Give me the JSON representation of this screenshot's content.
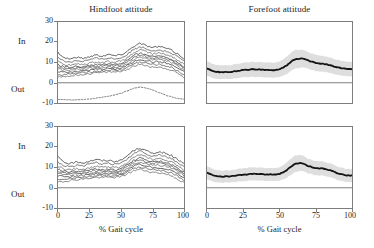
{
  "figure": {
    "xlabel": "% Gait cycle",
    "direction_labels": {
      "positive": "In",
      "negative": "Out"
    }
  },
  "chart_data": [
    {
      "id": "hindfoot-top",
      "type": "line",
      "title": "Hindfoot attitude",
      "xlabel": "% Gait cycle",
      "ylabel": "",
      "xlim": [
        0,
        100
      ],
      "ylim": [
        -10,
        30
      ],
      "xticks": [
        0,
        25,
        50,
        75,
        100
      ],
      "yticks": [
        -10,
        0,
        10,
        20,
        30
      ],
      "grid": false,
      "legend": "none",
      "zero_line": 0,
      "axis_direction_positive": "In",
      "axis_direction_negative": "Out",
      "x": [
        0,
        5,
        10,
        15,
        20,
        25,
        30,
        35,
        40,
        45,
        50,
        55,
        60,
        65,
        70,
        75,
        80,
        85,
        90,
        95,
        100
      ],
      "series": [
        {
          "name": "trial-1",
          "style": "solid",
          "values": [
            15.0,
            12.3,
            11.8,
            12.6,
            12.0,
            12.9,
            13.8,
            13.2,
            14.0,
            13.4,
            13.8,
            15.6,
            18.0,
            19.5,
            18.4,
            17.3,
            17.9,
            17.2,
            16.1,
            14.2,
            12.0
          ]
        },
        {
          "name": "trial-2",
          "style": "solid",
          "values": [
            12.4,
            10.6,
            10.3,
            11.0,
            10.6,
            11.4,
            12.1,
            11.6,
            12.3,
            11.8,
            12.2,
            14.0,
            16.4,
            17.9,
            16.9,
            15.8,
            16.3,
            15.6,
            14.5,
            12.8,
            10.7
          ]
        },
        {
          "name": "trial-3",
          "style": "solid",
          "values": [
            10.5,
            9.0,
            8.7,
            9.2,
            9.0,
            9.7,
            10.3,
            10.0,
            10.6,
            10.2,
            10.6,
            12.3,
            14.7,
            16.2,
            15.3,
            14.2,
            14.7,
            14.1,
            13.0,
            11.3,
            9.2
          ]
        },
        {
          "name": "trial-4",
          "style": "solid",
          "values": [
            9.0,
            7.8,
            7.6,
            8.0,
            7.9,
            8.5,
            9.0,
            8.8,
            9.3,
            9.0,
            9.4,
            11.0,
            13.3,
            14.7,
            13.9,
            12.9,
            13.3,
            12.8,
            11.7,
            10.0,
            8.0
          ]
        },
        {
          "name": "trial-5",
          "style": "solid",
          "values": [
            8.0,
            7.0,
            6.9,
            7.3,
            7.2,
            7.8,
            8.2,
            8.1,
            8.6,
            8.3,
            8.7,
            10.2,
            12.4,
            13.7,
            13.0,
            12.1,
            12.4,
            11.9,
            10.9,
            9.2,
            7.2
          ]
        },
        {
          "name": "trial-6",
          "style": "solid",
          "values": [
            7.0,
            6.2,
            6.2,
            6.6,
            6.6,
            7.1,
            7.5,
            7.4,
            7.9,
            7.7,
            8.0,
            9.4,
            11.5,
            12.7,
            12.1,
            11.3,
            11.5,
            11.0,
            10.0,
            8.3,
            6.3
          ]
        },
        {
          "name": "trial-7",
          "style": "solid",
          "values": [
            5.6,
            5.2,
            5.3,
            5.7,
            5.8,
            6.2,
            6.6,
            6.6,
            7.1,
            6.9,
            7.2,
            8.5,
            10.4,
            11.5,
            11.0,
            10.2,
            10.3,
            9.8,
            8.8,
            7.2,
            5.2
          ]
        },
        {
          "name": "trial-8",
          "style": "solid",
          "values": [
            4.0,
            4.0,
            4.3,
            4.7,
            4.9,
            5.3,
            5.7,
            5.8,
            6.2,
            6.1,
            6.4,
            7.6,
            9.3,
            10.2,
            9.7,
            9.0,
            9.0,
            8.5,
            7.5,
            5.9,
            3.9
          ]
        },
        {
          "name": "trial-9",
          "style": "solid",
          "values": [
            2.8,
            3.0,
            3.4,
            3.8,
            4.1,
            4.5,
            4.9,
            5.0,
            5.4,
            5.3,
            5.6,
            6.7,
            8.2,
            9.0,
            8.5,
            7.8,
            7.7,
            7.2,
            6.2,
            4.6,
            2.6
          ]
        },
        {
          "name": "reference-dotted",
          "style": "dotted",
          "values": [
            -8.2,
            -8.3,
            -8.4,
            -8.4,
            -8.3,
            -8.0,
            -7.6,
            -7.2,
            -6.7,
            -6.0,
            -5.2,
            -4.0,
            -2.8,
            -2.2,
            -2.6,
            -3.6,
            -4.8,
            -6.0,
            -7.0,
            -7.8,
            -8.2
          ]
        }
      ]
    },
    {
      "id": "forefoot-top",
      "type": "line",
      "title": "Forefoot attitude",
      "xlabel": "% Gait cycle",
      "ylabel": "",
      "xlim": [
        0,
        100
      ],
      "ylim": [
        -10,
        30
      ],
      "xticks": [
        0,
        25,
        50,
        75,
        100
      ],
      "yticks": [
        -10,
        0,
        10,
        20,
        30
      ],
      "grid": false,
      "legend": "none",
      "zero_line": 0,
      "band": "mean +/- 1 SD",
      "band_color": "#d9d9d9",
      "mean_color": "#111111",
      "x": [
        0,
        5,
        10,
        15,
        20,
        25,
        30,
        35,
        40,
        45,
        50,
        55,
        60,
        65,
        70,
        75,
        80,
        85,
        90,
        95,
        100
      ],
      "series": [
        {
          "name": "mean",
          "style": "solid-thick",
          "values": [
            7.0,
            5.6,
            5.2,
            5.3,
            5.7,
            6.2,
            6.6,
            6.6,
            6.4,
            6.3,
            6.5,
            8.6,
            11.4,
            12.1,
            10.9,
            9.9,
            9.4,
            8.7,
            7.6,
            6.9,
            6.6
          ]
        },
        {
          "name": "sd",
          "style": "band",
          "values": [
            3.6,
            3.5,
            3.4,
            3.4,
            3.5,
            3.6,
            3.7,
            3.7,
            3.7,
            3.7,
            3.8,
            4.3,
            4.6,
            4.4,
            4.1,
            4.0,
            3.9,
            3.8,
            3.7,
            3.6,
            3.6
          ]
        }
      ]
    },
    {
      "id": "hindfoot-bottom",
      "type": "line",
      "title": "",
      "xlabel": "% Gait cycle",
      "ylabel": "",
      "xlim": [
        0,
        100
      ],
      "ylim": [
        -10,
        30
      ],
      "xticks": [
        0,
        25,
        50,
        75,
        100
      ],
      "yticks": [
        -10,
        0,
        10,
        20,
        30
      ],
      "grid": false,
      "legend": "none",
      "zero_line": 0,
      "axis_direction_positive": "In",
      "axis_direction_negative": "Out",
      "x": [
        0,
        5,
        10,
        15,
        20,
        25,
        30,
        35,
        40,
        45,
        50,
        55,
        60,
        65,
        70,
        75,
        80,
        85,
        90,
        95,
        100
      ],
      "series": [
        {
          "name": "trial-1",
          "style": "solid",
          "values": [
            15.2,
            12.6,
            11.9,
            12.8,
            12.3,
            13.1,
            14.0,
            13.3,
            13.5,
            13.0,
            13.4,
            15.8,
            18.4,
            19.6,
            18.2,
            17.0,
            17.7,
            17.0,
            15.9,
            14.0,
            11.8
          ]
        },
        {
          "name": "trial-2",
          "style": "solid",
          "values": [
            12.6,
            10.9,
            10.4,
            11.2,
            10.8,
            11.6,
            12.4,
            11.8,
            12.0,
            11.6,
            12.0,
            14.2,
            16.8,
            18.1,
            16.8,
            15.6,
            16.1,
            15.4,
            14.3,
            12.5,
            10.4
          ]
        },
        {
          "name": "trial-3",
          "style": "solid",
          "values": [
            10.6,
            9.2,
            8.9,
            9.4,
            9.2,
            9.9,
            10.5,
            10.1,
            10.3,
            10.0,
            10.4,
            12.5,
            14.9,
            16.3,
            15.1,
            14.0,
            14.4,
            13.8,
            12.7,
            11.0,
            8.9
          ]
        },
        {
          "name": "trial-4",
          "style": "solid",
          "values": [
            9.2,
            8.0,
            7.8,
            8.2,
            8.1,
            8.7,
            9.2,
            8.9,
            9.1,
            8.8,
            9.2,
            11.2,
            13.5,
            14.8,
            13.7,
            12.7,
            13.0,
            12.5,
            11.4,
            9.7,
            7.7
          ]
        },
        {
          "name": "trial-5",
          "style": "solid",
          "values": [
            8.2,
            7.2,
            7.1,
            7.5,
            7.4,
            8.0,
            8.4,
            8.2,
            8.4,
            8.1,
            8.5,
            10.4,
            12.6,
            13.8,
            12.8,
            11.9,
            12.1,
            11.6,
            10.6,
            8.9,
            6.9
          ]
        },
        {
          "name": "trial-6",
          "style": "solid",
          "values": [
            7.2,
            6.4,
            6.4,
            6.8,
            6.8,
            7.3,
            7.7,
            7.5,
            7.7,
            7.5,
            7.8,
            9.6,
            11.7,
            12.8,
            11.9,
            11.1,
            11.2,
            10.7,
            9.7,
            8.0,
            6.0
          ]
        },
        {
          "name": "trial-7",
          "style": "solid",
          "values": [
            5.8,
            5.4,
            5.5,
            5.9,
            6.0,
            6.4,
            6.8,
            6.7,
            6.9,
            6.7,
            7.0,
            8.7,
            10.6,
            11.6,
            10.8,
            10.0,
            10.0,
            9.5,
            8.5,
            6.9,
            4.9
          ]
        },
        {
          "name": "trial-8",
          "style": "solid",
          "values": [
            4.2,
            4.2,
            4.5,
            4.9,
            5.1,
            5.5,
            5.9,
            5.9,
            6.0,
            5.9,
            6.2,
            7.8,
            9.5,
            10.3,
            9.5,
            8.8,
            8.7,
            8.2,
            7.2,
            5.6,
            3.6
          ]
        },
        {
          "name": "trial-9",
          "style": "solid",
          "values": [
            3.0,
            3.2,
            3.6,
            4.0,
            4.3,
            4.7,
            5.1,
            5.1,
            5.2,
            5.1,
            5.4,
            6.9,
            8.4,
            9.1,
            8.3,
            7.6,
            7.4,
            6.9,
            5.9,
            4.3,
            2.3
          ]
        }
      ]
    },
    {
      "id": "forefoot-bottom",
      "type": "line",
      "title": "",
      "xlabel": "% Gait cycle",
      "ylabel": "",
      "xlim": [
        0,
        100
      ],
      "ylim": [
        -10,
        30
      ],
      "xticks": [
        0,
        25,
        50,
        75,
        100
      ],
      "yticks": [
        -10,
        0,
        10,
        20,
        30
      ],
      "grid": false,
      "legend": "none",
      "zero_line": 0,
      "band": "mean +/- 1 SD",
      "band_color": "#d9d9d9",
      "mean_color": "#111111",
      "x": [
        0,
        5,
        10,
        15,
        20,
        25,
        30,
        35,
        40,
        45,
        50,
        55,
        60,
        65,
        70,
        75,
        80,
        85,
        90,
        95,
        100
      ],
      "series": [
        {
          "name": "mean",
          "style": "solid-thick",
          "values": [
            7.4,
            6.0,
            5.4,
            5.6,
            6.0,
            6.4,
            6.8,
            6.8,
            6.6,
            6.5,
            6.7,
            8.8,
            11.6,
            12.3,
            10.7,
            9.7,
            9.5,
            8.6,
            7.2,
            6.2,
            6.0
          ]
        },
        {
          "name": "sd",
          "style": "band",
          "values": [
            3.2,
            3.1,
            3.0,
            3.0,
            3.1,
            3.2,
            3.2,
            3.2,
            3.2,
            3.2,
            3.3,
            3.8,
            4.1,
            3.9,
            3.6,
            3.5,
            3.5,
            3.4,
            3.3,
            3.2,
            3.2
          ]
        }
      ]
    }
  ]
}
